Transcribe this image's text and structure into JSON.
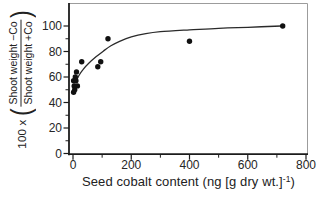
{
  "chart_data": {
    "type": "scatter",
    "title": "",
    "xlabel_pre": "Seed cobalt content (ng [g dry wt.]",
    "xlabel_sup": "-1",
    "xlabel_post": ")",
    "ylabel_prefix": "100 x",
    "ylabel_open_paren": "(",
    "ylabel_close_paren": ")",
    "ylabel_numerator": "Shoot weight −Co",
    "ylabel_denominator": "Shoot weight +Co",
    "xlim": [
      0,
      800
    ],
    "ylim": [
      0,
      100
    ],
    "x_ticks": [
      0,
      200,
      400,
      600,
      800
    ],
    "x_minor_ticks": [
      100,
      300,
      500,
      700
    ],
    "y_ticks": [
      0,
      20,
      40,
      60,
      80,
      100
    ],
    "y_minor_ticks": [
      10,
      30,
      50,
      70,
      90
    ],
    "grid": false,
    "legend": "none",
    "points": [
      [
        2,
        48
      ],
      [
        6,
        50
      ],
      [
        4,
        53
      ],
      [
        15,
        53
      ],
      [
        2,
        57
      ],
      [
        10,
        57
      ],
      [
        8,
        60
      ],
      [
        12,
        64
      ],
      [
        30,
        72
      ],
      [
        85,
        68
      ],
      [
        95,
        72
      ],
      [
        120,
        90
      ],
      [
        400,
        88
      ],
      [
        720,
        100
      ]
    ],
    "fit_curve": [
      [
        10,
        56
      ],
      [
        20,
        61
      ],
      [
        35,
        66
      ],
      [
        55,
        71
      ],
      [
        80,
        76
      ],
      [
        105,
        80.5
      ],
      [
        130,
        84.5
      ],
      [
        160,
        88
      ],
      [
        200,
        91.5
      ],
      [
        250,
        94
      ],
      [
        300,
        95.5
      ],
      [
        400,
        97
      ],
      [
        500,
        98.2
      ],
      [
        600,
        99
      ],
      [
        715,
        100
      ]
    ],
    "colors": {
      "axis": "#1c1c1c",
      "frame_light": "#9c9c9c",
      "marker": "#111111",
      "curve": "#2a2a2a",
      "text": "#262626"
    }
  }
}
